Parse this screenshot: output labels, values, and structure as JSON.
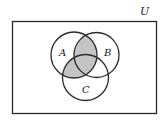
{
  "diagram": {
    "type": "venn",
    "universe_label": "U",
    "sets": [
      {
        "label": "A"
      },
      {
        "label": "B"
      },
      {
        "label": "C"
      }
    ],
    "shaded_region": "A ∩ (B ∪ C)",
    "colors": {
      "stroke": "#2a2a2a",
      "shade": "#c4c4c4",
      "background": "#ffffff"
    }
  }
}
